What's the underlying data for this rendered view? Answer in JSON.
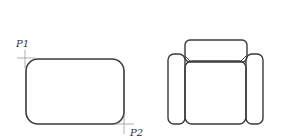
{
  "figures": {
    "left": {
      "description": "rounded-rectangle drawn by two corner points",
      "points": [
        {
          "label": "P1"
        },
        {
          "label": "P2"
        }
      ]
    },
    "right": {
      "description": "armchair plan view (backrest, two arms, seat)"
    }
  },
  "colors": {
    "stroke": "#3a3a3a",
    "thin": "#7a7a7a",
    "background": "#ffffff"
  }
}
